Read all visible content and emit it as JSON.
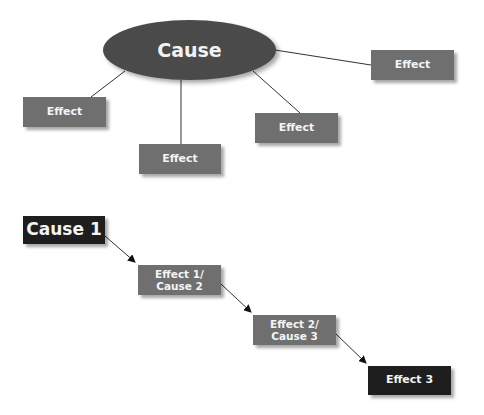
{
  "diagram_1": {
    "cause": {
      "label": "Cause"
    },
    "effects": [
      {
        "label": "Effect"
      },
      {
        "label": "Effect"
      },
      {
        "label": "Effect"
      },
      {
        "label": "Effect"
      }
    ]
  },
  "diagram_2": {
    "chain": [
      {
        "label": "Cause 1"
      },
      {
        "line1": "Effect 1/",
        "line2": "Cause 2"
      },
      {
        "line1": "Effect 2/",
        "line2": "Cause 3"
      },
      {
        "label": "Effect 3"
      }
    ]
  },
  "colors": {
    "ellipse": "#4a4a4a",
    "effect_box": "#6f6f6f",
    "dark_box": "#1e1e1e",
    "line": "#333333"
  }
}
